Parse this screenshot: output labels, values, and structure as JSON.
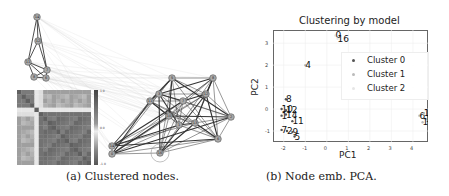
{
  "figure_a": {
    "caption": "(a) Clustered nodes.",
    "small_graph_nodes": [
      {
        "id": "14",
        "x": 37,
        "y": 17
      },
      {
        "id": "12",
        "x": 38,
        "y": 41
      },
      {
        "id": "11",
        "x": 28,
        "y": 62
      },
      {
        "id": "7",
        "x": 47,
        "y": 70
      },
      {
        "id": "8",
        "x": 34,
        "y": 77
      },
      {
        "id": "6",
        "x": 46,
        "y": 78
      }
    ],
    "large_graph_nodes": [
      {
        "id": "5",
        "x": 172,
        "y": 78
      },
      {
        "id": "8",
        "x": 213,
        "y": 78
      },
      {
        "id": "3",
        "x": 159,
        "y": 94
      },
      {
        "id": "11",
        "x": 150,
        "y": 101
      },
      {
        "id": "7",
        "x": 183,
        "y": 101
      },
      {
        "id": "12",
        "x": 206,
        "y": 94
      },
      {
        "id": "10",
        "x": 169,
        "y": 116
      },
      {
        "id": "1",
        "x": 179,
        "y": 125
      },
      {
        "id": "13",
        "x": 195,
        "y": 123
      },
      {
        "id": "2",
        "x": 231,
        "y": 117
      },
      {
        "id": "6",
        "x": 218,
        "y": 139
      },
      {
        "id": "14",
        "x": 112,
        "y": 146
      },
      {
        "id": "0",
        "x": 112,
        "y": 154
      },
      {
        "id": "16",
        "x": 160,
        "y": 153
      }
    ],
    "heatmap": {
      "colorbar_ticks": [
        "1.0",
        "0.5",
        "0.0",
        "-0.5",
        "-1.0"
      ]
    }
  },
  "figure_b": {
    "caption": "(b) Node emb. PCA."
  },
  "chart_data": {
    "type": "scatter",
    "title": "Clustering by model",
    "xlabel": "PC1",
    "ylabel": "PC2",
    "xlim": [
      -2.5,
      4.7
    ],
    "ylim": [
      -1.5,
      3.6
    ],
    "xticks": [
      "-2",
      "-1",
      "0",
      "1",
      "2",
      "3",
      "4"
    ],
    "yticks": [
      "3",
      "2",
      "1",
      "0",
      "-1"
    ],
    "grid": true,
    "legend_position": "upper right",
    "legend": [
      {
        "label": "Cluster 0",
        "color": "#555555"
      },
      {
        "label": "Cluster 1",
        "color": "#bbbbbb"
      },
      {
        "label": "Cluster 2",
        "color": "#e6e6e6"
      }
    ],
    "points": [
      {
        "label": "0",
        "x": 0.4,
        "y": 3.35,
        "cluster": 2
      },
      {
        "label": "16",
        "x": 0.5,
        "y": 3.2,
        "cluster": 2
      },
      {
        "label": "4",
        "x": -1.0,
        "y": 2.0,
        "cluster": 1
      },
      {
        "label": "8",
        "x": -1.9,
        "y": 0.45,
        "cluster": 0
      },
      {
        "label": "10",
        "x": -2.1,
        "y": 0.0,
        "cluster": 0
      },
      {
        "label": "12",
        "x": -1.9,
        "y": -0.05,
        "cluster": 0
      },
      {
        "label": "1",
        "x": -2.1,
        "y": -0.3,
        "cluster": 0
      },
      {
        "label": "14",
        "x": -1.9,
        "y": -0.25,
        "cluster": 0
      },
      {
        "label": "11",
        "x": -1.6,
        "y": -0.55,
        "cluster": 0
      },
      {
        "label": "7",
        "x": -2.1,
        "y": -0.95,
        "cluster": 0
      },
      {
        "label": "2",
        "x": -1.85,
        "y": -1.0,
        "cluster": 0
      },
      {
        "label": "9",
        "x": -1.6,
        "y": -1.05,
        "cluster": 0
      },
      {
        "label": "5",
        "x": -1.5,
        "y": -1.25,
        "cluster": 0
      },
      {
        "label": "6",
        "x": 4.3,
        "y": -0.3,
        "cluster": 1
      },
      {
        "label": "14",
        "x": 4.5,
        "y": -0.2,
        "cluster": 1
      },
      {
        "label": "13",
        "x": 4.6,
        "y": -0.45,
        "cluster": 1
      },
      {
        "label": "15",
        "x": 4.45,
        "y": -0.6,
        "cluster": 1
      }
    ]
  }
}
